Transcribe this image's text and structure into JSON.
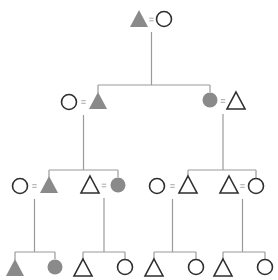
{
  "diagram": {
    "type": "kinship",
    "fill_color": "#8a8a8a",
    "outline_color": "#2e2e2e",
    "line_color": "#9a9a9a",
    "individuals": [
      {
        "id": "g1-m",
        "gen": 1,
        "sex": "male",
        "filled": true
      },
      {
        "id": "g1-f",
        "gen": 1,
        "sex": "female",
        "filled": false
      },
      {
        "id": "g2-a-f",
        "gen": 2,
        "sex": "female",
        "filled": false
      },
      {
        "id": "g2-a-m",
        "gen": 2,
        "sex": "male",
        "filled": true
      },
      {
        "id": "g2-b-f",
        "gen": 2,
        "sex": "female",
        "filled": true
      },
      {
        "id": "g2-b-m",
        "gen": 2,
        "sex": "male",
        "filled": false
      },
      {
        "id": "g3-a-f",
        "gen": 3,
        "sex": "female",
        "filled": false
      },
      {
        "id": "g3-a-m",
        "gen": 3,
        "sex": "male",
        "filled": true
      },
      {
        "id": "g3-b-m",
        "gen": 3,
        "sex": "male",
        "filled": false
      },
      {
        "id": "g3-b-f",
        "gen": 3,
        "sex": "female",
        "filled": true
      },
      {
        "id": "g3-c-f",
        "gen": 3,
        "sex": "female",
        "filled": false
      },
      {
        "id": "g3-c-m",
        "gen": 3,
        "sex": "male",
        "filled": false
      },
      {
        "id": "g3-d-m",
        "gen": 3,
        "sex": "male",
        "filled": false
      },
      {
        "id": "g3-d-f",
        "gen": 3,
        "sex": "female",
        "filled": false
      },
      {
        "id": "g4-a-m",
        "gen": 4,
        "sex": "male",
        "filled": true
      },
      {
        "id": "g4-a-f",
        "gen": 4,
        "sex": "female",
        "filled": true
      },
      {
        "id": "g4-b-m",
        "gen": 4,
        "sex": "male",
        "filled": false
      },
      {
        "id": "g4-b-f",
        "gen": 4,
        "sex": "female",
        "filled": false
      },
      {
        "id": "g4-c-m",
        "gen": 4,
        "sex": "male",
        "filled": false
      },
      {
        "id": "g4-c-f",
        "gen": 4,
        "sex": "female",
        "filled": false
      },
      {
        "id": "g4-d-m",
        "gen": 4,
        "sex": "male",
        "filled": false
      },
      {
        "id": "g4-d-f",
        "gen": 4,
        "sex": "female",
        "filled": false
      }
    ],
    "marriages": [
      [
        "g1-m",
        "g1-f"
      ],
      [
        "g2-a-f",
        "g2-a-m"
      ],
      [
        "g2-b-f",
        "g2-b-m"
      ],
      [
        "g3-a-f",
        "g3-a-m"
      ],
      [
        "g3-b-m",
        "g3-b-f"
      ],
      [
        "g3-c-f",
        "g3-c-m"
      ],
      [
        "g3-d-m",
        "g3-d-f"
      ]
    ],
    "descent": [
      {
        "parents": [
          "g1-m",
          "g1-f"
        ],
        "children": [
          "g2-a-m",
          "g2-b-f"
        ]
      },
      {
        "parents": [
          "g2-a-f",
          "g2-a-m"
        ],
        "children": [
          "g3-a-m",
          "g3-b-f"
        ]
      },
      {
        "parents": [
          "g2-b-f",
          "g2-b-m"
        ],
        "children": [
          "g3-c-m",
          "g3-d-f"
        ]
      },
      {
        "parents": [
          "g3-a-f",
          "g3-a-m"
        ],
        "children": [
          "g4-a-m",
          "g4-a-f"
        ]
      },
      {
        "parents": [
          "g3-b-m",
          "g3-b-f"
        ],
        "children": [
          "g4-b-m",
          "g4-b-f"
        ]
      },
      {
        "parents": [
          "g3-c-f",
          "g3-c-m"
        ],
        "children": [
          "g4-c-m",
          "g4-c-f"
        ]
      },
      {
        "parents": [
          "g3-d-m",
          "g3-d-f"
        ],
        "children": [
          "g4-d-m",
          "g4-d-f"
        ]
      }
    ],
    "legend": {
      "triangle": "male",
      "circle": "female",
      "equals": "marriage",
      "filled": "shaded lineage member"
    }
  }
}
